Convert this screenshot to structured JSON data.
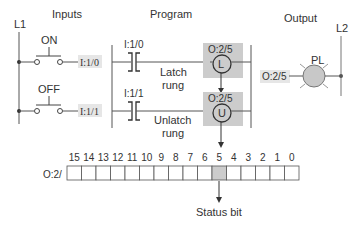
{
  "titles": {
    "inputs": "Inputs",
    "program": "Program",
    "output": "Output",
    "rail_left": "L1",
    "rail_right": "L2"
  },
  "inputs": [
    {
      "label": "ON",
      "address": "I:1/0"
    },
    {
      "label": "OFF",
      "address": "I:1/1"
    }
  ],
  "rungs": [
    {
      "contact_address": "I:1/0",
      "coil_address": "O:2/5",
      "coil_type": "L",
      "caption_line1": "Latch",
      "caption_line2": "rung"
    },
    {
      "contact_address": "I:1/1",
      "coil_address": "O:2/5",
      "coil_type": "U",
      "caption_line1": "Unlatch",
      "caption_line2": "rung"
    }
  ],
  "output_device": {
    "label": "PL",
    "address": "O:2/5"
  },
  "register": {
    "name": "O:2/",
    "bits": [
      "15",
      "14",
      "13",
      "12",
      "11",
      "10",
      "9",
      "8",
      "7",
      "6",
      "5",
      "4",
      "3",
      "2",
      "1",
      "0"
    ],
    "highlighted_bit": "5",
    "caption": "Status bit"
  },
  "colors": {
    "line": "#555555",
    "highlight": "#cccccc",
    "lamp": "#c8c8c8"
  }
}
